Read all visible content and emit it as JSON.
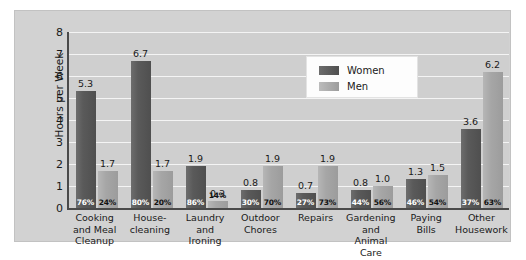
{
  "chart_data": {
    "type": "bar",
    "title": "",
    "xlabel": "",
    "ylabel": "Hours per Week",
    "ylim": [
      0,
      8
    ],
    "yticks": [
      8,
      7,
      6,
      5,
      4,
      3,
      2,
      1,
      0
    ],
    "grid": true,
    "legend_position": "top-right",
    "categories": [
      "Cooking and Meal Cleanup",
      "House-cleaning",
      "Laundry and Ironing",
      "Outdoor Chores",
      "Repairs",
      "Gardening and Animal Care",
      "Paying Bills",
      "Other Housework"
    ],
    "category_lines": [
      [
        "Cooking",
        "and Meal",
        "Cleanup"
      ],
      [
        "House-",
        "cleaning"
      ],
      [
        "Laundry",
        "and",
        "Ironing"
      ],
      [
        "Outdoor",
        "Chores"
      ],
      [
        "Repairs"
      ],
      [
        "Gardening",
        "and",
        "Animal Care"
      ],
      [
        "Paying",
        "Bills"
      ],
      [
        "Other",
        "Housework"
      ]
    ],
    "series": [
      {
        "name": "Women",
        "color": "#555555",
        "values": [
          5.3,
          6.7,
          1.9,
          0.8,
          0.7,
          0.8,
          1.3,
          3.6
        ],
        "percents": [
          "76%",
          "80%",
          "86%",
          "30%",
          "27%",
          "44%",
          "46%",
          "37%"
        ]
      },
      {
        "name": "Men",
        "color": "#a6a6a6",
        "values": [
          1.7,
          1.7,
          0.3,
          1.9,
          1.9,
          1.0,
          1.5,
          6.2
        ],
        "percents": [
          "24%",
          "20%",
          "14%",
          "70%",
          "73%",
          "56%",
          "54%",
          "63%"
        ]
      }
    ]
  },
  "legend": {
    "items": [
      {
        "label": "Women",
        "swatch": "women"
      },
      {
        "label": "Men",
        "swatch": "men"
      }
    ]
  }
}
